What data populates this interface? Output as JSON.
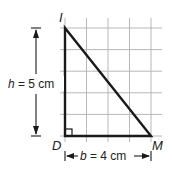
{
  "diagram": {
    "type": "right-triangle-on-grid",
    "vertices": {
      "top": "I",
      "bottom_left": "D",
      "bottom_right": "M"
    },
    "height_label": {
      "var": "h",
      "eq": " = 5 cm"
    },
    "base_label": {
      "var": "b",
      "eq": " = 4 cm"
    },
    "grid": {
      "columns": 4,
      "rows": 5,
      "unit": "cm"
    },
    "colors": {
      "grid": "#b8b8b8",
      "triangle": "#1a1a1a",
      "text": "#222222"
    }
  }
}
